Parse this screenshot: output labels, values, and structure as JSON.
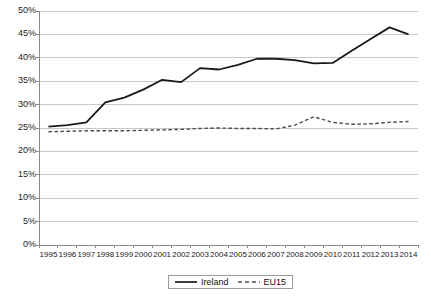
{
  "chart_data": {
    "type": "line",
    "title": "",
    "xlabel": "",
    "ylabel": "",
    "grid": true,
    "legend_position": "bottom-center",
    "ylim": [
      0,
      50
    ],
    "ytick_labels": [
      "50%",
      "45%",
      "40%",
      "35%",
      "30%",
      "25%",
      "20%",
      "15%",
      "10%",
      "5%",
      "0%"
    ],
    "ytick_values": [
      50,
      45,
      40,
      35,
      30,
      25,
      20,
      15,
      10,
      5,
      0
    ],
    "categories": [
      "1995",
      "1996",
      "1997",
      "1998",
      "1999",
      "2000",
      "2001",
      "2002",
      "2003",
      "2004",
      "2005",
      "2006",
      "2007",
      "2008",
      "2009",
      "2010",
      "2011",
      "2012",
      "2013",
      "2014"
    ],
    "series": [
      {
        "name": "Ireland",
        "style": "solid",
        "color": "#1a1a1a",
        "values": [
          25.3,
          25.6,
          26.2,
          30.5,
          31.5,
          33.2,
          35.3,
          34.8,
          37.8,
          37.5,
          38.5,
          39.8,
          39.8,
          39.5,
          38.8,
          38.9,
          41.5,
          44.0,
          46.5,
          45.0
        ]
      },
      {
        "name": "EU15",
        "style": "dashed",
        "color": "#4a4a4a",
        "values": [
          24.2,
          24.3,
          24.4,
          24.4,
          24.4,
          24.5,
          24.6,
          24.7,
          24.9,
          25.0,
          24.9,
          24.9,
          24.8,
          25.6,
          27.4,
          26.2,
          25.8,
          25.9,
          26.2,
          26.4
        ]
      }
    ]
  },
  "legend": {
    "items": [
      {
        "label": "Ireland",
        "style": "solid"
      },
      {
        "label": "EU15",
        "style": "dashed"
      }
    ]
  },
  "colors": {
    "ireland_line": "#1a1a1a",
    "eu15_line": "#4a4a4a",
    "gridline": "#c8c8c8",
    "axis": "#8a8a8a",
    "text": "#222222",
    "background": "#ffffff"
  }
}
